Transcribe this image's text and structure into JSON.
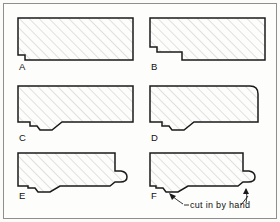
{
  "figure": {
    "background_color": "#fbfbfa",
    "frame_color": "#8e8e8e",
    "line_color": "#1a1a1a",
    "hatch_color": "#b4b4b4",
    "fill_color": "#fdfdfc"
  },
  "annotation": {
    "text": "cut in by hand"
  },
  "stages": [
    {
      "id": "A",
      "label": "A",
      "caption": "A",
      "description": "Plain rectangular blank with small square rebate notched at the lower left corner",
      "label_x": 19,
      "label_y": 70,
      "points": "18,18 133,18 133,60 25,60 25,55 18,55"
    },
    {
      "id": "B",
      "label": "B",
      "caption": "B",
      "description": "Stepped rebate cut along the underside, stepping up toward the right",
      "label_x": 151,
      "label_y": 70,
      "points": "150,18 265,18 265,60 182,60 182,52 157,52 157,47 150,47"
    },
    {
      "id": "C",
      "label": "C",
      "caption": "C",
      "description": "Sloped chamfer blended from the step into the lower left quirk",
      "label_x": 19,
      "label_y": 141,
      "points": "18,86 133,86 133,122 62,122 52,130 40,130 37,126 30,126 30,122 18,122"
    },
    {
      "id": "D",
      "label": "D",
      "caption": "D",
      "description": "As C with the upper right corner rounded over into an ovolo",
      "label_x": 151,
      "label_y": 141,
      "points": "150,86 258,86 258,122 194,122 184,130 172,130 169,126 162,126 162,122 150,122",
      "round_corner": true
    },
    {
      "id": "E",
      "label": "E",
      "caption": "E",
      "description": "Right hand edge worked into a projecting bead and fillet lip",
      "label_x": 19,
      "label_y": 199,
      "points": "18,153 115,153 115,172 124,172 126,176 124,182 116,182 110,186 60,186 50,192 38,192 35,188 28,188 28,186 18,186"
    },
    {
      "id": "F",
      "label": "F",
      "caption": "F",
      "description": "Finished profile with the quirk and bead cut in by hand",
      "label_x": 151,
      "label_y": 199,
      "points": "150,153 243,153 243,172 252,172 254,176 252,182 244,182 238,186 188,186 178,192 166,192 163,188 156,188 156,186 150,186"
    }
  ],
  "leaders": [
    {
      "name": "leader-to-f-notch",
      "path": "M 178,203 L 168,195",
      "head": "168,195 174,196 172,201"
    },
    {
      "name": "leader-to-f-bead",
      "path": "M 245,203 L 247,190",
      "head": "247,190 250,195 244,196"
    },
    {
      "name": "leader-text-left",
      "path": "M 181,203 L 186,203"
    },
    {
      "name": "leader-text-right",
      "path": "M 242,203 L 247,194"
    }
  ]
}
